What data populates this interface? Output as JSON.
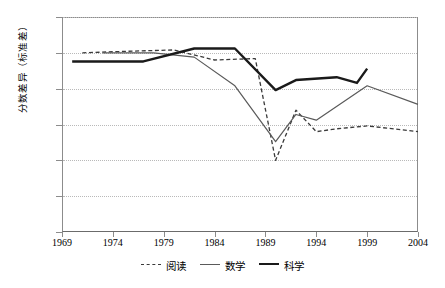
{
  "chart_data": {
    "type": "line",
    "title": "",
    "subtitle": "",
    "xlabel": "",
    "ylabel": "分数差异（标准差）",
    "xlim": [
      1969,
      2004
    ],
    "ylim": [
      0,
      1.5
    ],
    "grid": true,
    "grid_axis": "y",
    "legend_position": "bottom",
    "xticks": [
      1969,
      1974,
      1979,
      1984,
      1989,
      1994,
      1999,
      2004
    ],
    "xtick_labels": [
      "1969",
      "1974",
      "1979",
      "1984",
      "1989",
      "1994",
      "1999",
      "2004"
    ],
    "yticks": [
      0,
      0.25,
      0.5,
      0.75,
      1,
      1.25,
      1.5
    ],
    "ytick_labels": [
      "0",
      "0.25",
      "0.5",
      "0.75",
      "1",
      "1.25",
      "1.5"
    ],
    "series": [
      {
        "name": "阅读",
        "style": "dashed",
        "color": "#3a3a3a",
        "x": [
          1971,
          1975,
          1980,
          1984,
          1988,
          1990,
          1992,
          1994,
          1996,
          1999,
          2004
        ],
        "values": [
          1.25,
          1.26,
          1.27,
          1.2,
          1.21,
          0.5,
          0.85,
          0.7,
          0.72,
          0.74,
          0.7
        ]
      },
      {
        "name": "数学",
        "style": "solid-thin",
        "color": "#5a5a5a",
        "x": [
          1973,
          1978,
          1982,
          1986,
          1990,
          1992,
          1994,
          1999,
          2004
        ],
        "values": [
          1.25,
          1.25,
          1.22,
          1.02,
          0.63,
          0.82,
          0.78,
          1.02,
          0.89
        ]
      },
      {
        "name": "科学",
        "style": "solid-thick",
        "color": "#1a1a1a",
        "x": [
          1970,
          1977,
          1982,
          1986,
          1990,
          1992,
          1996,
          1998,
          1999
        ],
        "values": [
          1.19,
          1.19,
          1.28,
          1.28,
          0.99,
          1.06,
          1.08,
          1.04,
          1.14
        ]
      }
    ]
  },
  "legend": {
    "items": [
      {
        "label": "阅读",
        "swatch": "dashed-line-icon"
      },
      {
        "label": "数学",
        "swatch": "thin-line-icon"
      },
      {
        "label": "科学",
        "swatch": "thick-line-icon"
      }
    ]
  },
  "caption": {
    "text": ""
  }
}
